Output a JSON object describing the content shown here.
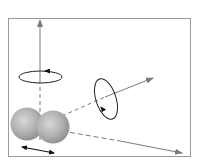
{
  "diagram": {
    "title": "",
    "colors": {
      "frame": "#9a9a9a",
      "axis": "#7a7a7a",
      "sphere_light": "#d8d8d8",
      "sphere_dark": "#8c8c8c",
      "rotation_curve": "#222222",
      "double_arrow": "#111111",
      "background": "#ffffff"
    },
    "elements": [
      {
        "id": "atom-left",
        "type": "sphere"
      },
      {
        "id": "atom-right",
        "type": "sphere"
      },
      {
        "id": "axis-vertical",
        "type": "arrow",
        "with_rotation": true
      },
      {
        "id": "axis-diagonal",
        "type": "arrow",
        "with_rotation": true
      },
      {
        "id": "axis-bond",
        "type": "arrow",
        "with_rotation": false
      },
      {
        "id": "stretch",
        "type": "double-arrow"
      }
    ]
  }
}
